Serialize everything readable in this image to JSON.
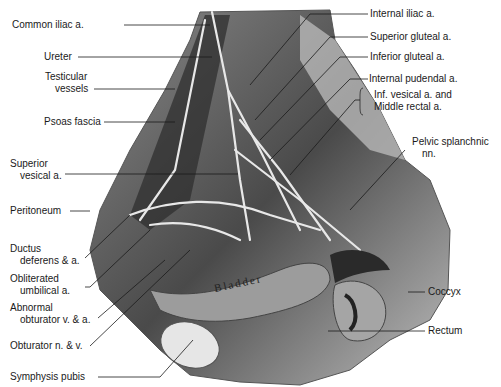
{
  "figure": {
    "background": "#ffffff",
    "ink_color": "#1a1a1a",
    "organ_text": "Bladder"
  },
  "labels_left": [
    {
      "id": "common-iliac",
      "text": "Common iliac a."
    },
    {
      "id": "ureter",
      "text": "Ureter"
    },
    {
      "id": "testicular",
      "line1": "Testicular",
      "line2": "vessels"
    },
    {
      "id": "psoas",
      "text": "Psoas fascia"
    },
    {
      "id": "sup-vesical",
      "line1": "Superior",
      "line2": "vesical a."
    },
    {
      "id": "peritoneum",
      "text": "Peritoneum"
    },
    {
      "id": "ductus",
      "line1": "Ductus",
      "line2": "deferens & a."
    },
    {
      "id": "oblit-umb",
      "line1": "Obliterated",
      "line2": "umbilical a."
    },
    {
      "id": "abn-obt",
      "line1": "Abnormal",
      "line2": "obturator v. & a."
    },
    {
      "id": "obturator",
      "text": "Obturator n. & v."
    },
    {
      "id": "symphysis",
      "text": "Symphysis pubis"
    }
  ],
  "labels_right": [
    {
      "id": "int-iliac",
      "text": "Internal iliac a."
    },
    {
      "id": "sup-gluteal",
      "text": "Superior gluteal a."
    },
    {
      "id": "inf-gluteal",
      "text": "Inferior gluteal a."
    },
    {
      "id": "int-pudendal",
      "text": "Internal pudendal a."
    },
    {
      "id": "inf-vesical",
      "line1": "Inf. vesical a. and",
      "line2": "Middle rectal a."
    },
    {
      "id": "pelvic-splanchnic",
      "line1": "Pelvic splanchnic",
      "line2": "nn."
    },
    {
      "id": "coccyx",
      "text": "Coccyx"
    },
    {
      "id": "rectum",
      "text": "Rectum"
    }
  ]
}
